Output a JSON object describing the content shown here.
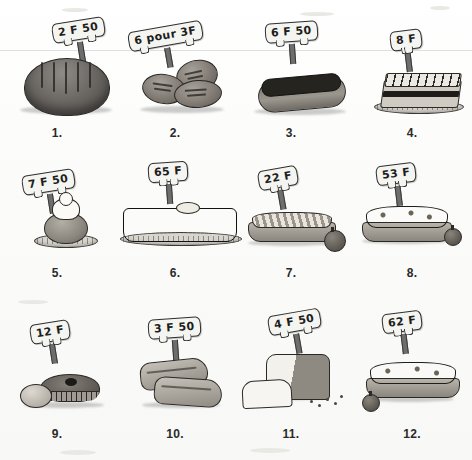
{
  "page": {
    "medium": "grayscale pen-and-ink scan",
    "background_color": "#fdfdfb",
    "ink_color": "#1b1b1b",
    "grid": {
      "columns": 4,
      "rows": 3,
      "total_items": 12
    }
  },
  "items": [
    {
      "number": "1.",
      "price": "2 F 50",
      "item_name": "round-bread-loaf",
      "icon": "round-loaf-icon"
    },
    {
      "number": "2.",
      "price": "6 pour 3F",
      "item_name": "bread-rolls",
      "icon": "bread-rolls-icon"
    },
    {
      "number": "3.",
      "price": "6 F 50",
      "item_name": "chocolate-eclair",
      "icon": "eclair-icon"
    },
    {
      "number": "4.",
      "price": "8 F",
      "item_name": "millefeuille-pastry",
      "icon": "millefeuille-icon"
    },
    {
      "number": "5.",
      "price": "7 F 50",
      "item_name": "cream-puff",
      "icon": "choux-cream-icon"
    },
    {
      "number": "6.",
      "price": "65 F",
      "item_name": "chocolate-cake",
      "icon": "round-cake-icon"
    },
    {
      "number": "7.",
      "price": "22 F",
      "item_name": "apple-tart",
      "icon": "apple-tart-icon"
    },
    {
      "number": "8.",
      "price": "53 F",
      "item_name": "berry-tart",
      "icon": "berry-tart-icon"
    },
    {
      "number": "9.",
      "price": "12 F",
      "item_name": "small-fruit-pie",
      "icon": "small-pie-icon"
    },
    {
      "number": "10.",
      "price": "3 F 50",
      "item_name": "bread-slices",
      "icon": "bread-slices-icon"
    },
    {
      "number": "11.",
      "price": "4 F 50",
      "item_name": "sandwich-loaf",
      "icon": "pain-de-mie-icon"
    },
    {
      "number": "12.",
      "price": "62 F",
      "item_name": "plum-tart",
      "icon": "plum-tart-icon"
    }
  ]
}
